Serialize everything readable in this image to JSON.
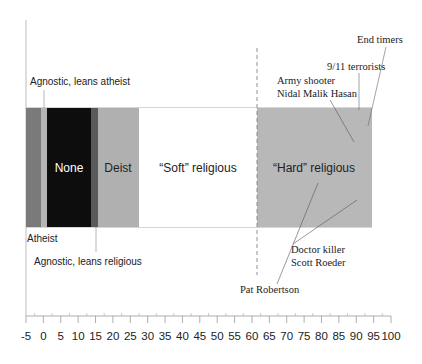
{
  "chart_data": {
    "type": "bar",
    "orientation": "horizontal-stacked-spectrum",
    "title": "",
    "xlabel": "",
    "ylabel": "",
    "xlim": [
      -5,
      100
    ],
    "grid": false,
    "legend": "none",
    "x_ticks": [
      -5,
      0,
      5,
      10,
      15,
      20,
      25,
      30,
      35,
      40,
      45,
      50,
      55,
      60,
      65,
      70,
      75,
      80,
      85,
      90,
      95,
      100
    ],
    "x_tick_labels": [
      "-5",
      "0",
      "5",
      "10",
      "15",
      "20",
      "25",
      "30",
      "35",
      "40",
      "45",
      "50",
      "55",
      "60",
      "65",
      "70",
      "75",
      "80",
      "85",
      "90",
      "95",
      "100"
    ],
    "segments": [
      {
        "name": "Atheist",
        "start": -5,
        "end": -0.7,
        "color": "#7a7a7a",
        "label": ""
      },
      {
        "name": "Agnostic, leans atheist",
        "start": -0.7,
        "end": 1,
        "color": "#b5b5b5",
        "label": ""
      },
      {
        "name": "None",
        "start": 1,
        "end": 13.5,
        "color": "#0d0d0d",
        "label": "None"
      },
      {
        "name": "Agnostic, leans religious",
        "start": 13.5,
        "end": 15.5,
        "color": "#5a5a5a",
        "label": ""
      },
      {
        "name": "Deist",
        "start": 15.5,
        "end": 27,
        "color": "#b0b0b0",
        "label": "Deist"
      },
      {
        "name": "\"Soft\" religious",
        "start": 27,
        "end": 61.5,
        "color": "#ffffff",
        "label": "“Soft” religious"
      },
      {
        "name": "\"Hard\" religious",
        "start": 61.5,
        "end": 94.5,
        "color": "#b8b8b8",
        "label": "“Hard” religious"
      }
    ],
    "divider_x": 61.5,
    "annotations": [
      {
        "text": "Agnostic, leans atheist",
        "points_to_x": 0
      },
      {
        "text": "Atheist",
        "points_to_x": -5
      },
      {
        "text": "Agnostic, leans religious",
        "points_to_x": 14.5
      },
      {
        "text": "Army shooter",
        "points_to_x": 89
      },
      {
        "text": "Nidal Malik Hasan",
        "points_to_x": 89
      },
      {
        "text": "9/11 terrorists",
        "points_to_x": 91
      },
      {
        "text": "End timers",
        "points_to_x": 94.5
      },
      {
        "text": "Doctor killer",
        "points_to_x": 90.5
      },
      {
        "text": "Scott Roeder",
        "points_to_x": 90.5
      },
      {
        "text": "Pat Robertson",
        "points_to_x": 77
      }
    ]
  },
  "labels": {
    "none": "None",
    "deist": "Deist",
    "soft": "“Soft” religious",
    "hard": "“Hard” religious",
    "agnostic_atheist": "Agnostic, leans atheist",
    "atheist": "Atheist",
    "agnostic_religious": "Agnostic, leans religious",
    "army_shooter_1": "Army shooter",
    "army_shooter_2": "Nidal Malik Hasan",
    "terrorists": "9/11 terrorists",
    "end_timers": "End timers",
    "doctor_killer_1": "Doctor killer",
    "doctor_killer_2": "Scott Roeder",
    "pat_robertson": "Pat Robertson"
  },
  "ticks": [
    "-5",
    "0",
    "5",
    "10",
    "15",
    "20",
    "25",
    "30",
    "35",
    "40",
    "45",
    "50",
    "55",
    "60",
    "65",
    "70",
    "75",
    "80",
    "85",
    "90",
    "95",
    "100"
  ]
}
